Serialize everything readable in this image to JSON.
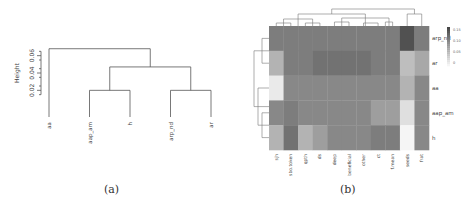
{
  "chart_data": [
    {
      "type": "dendrogram",
      "caption": "(a)",
      "ylabel": "Height",
      "yticks": [
        "0.02",
        "0.04",
        "0.06"
      ],
      "ylim": [
        0.01,
        0.07
      ],
      "leaves": [
        "aa",
        "aap_am",
        "h",
        "arp_nd",
        "ar"
      ],
      "merges": [
        {
          "left": "aap_am",
          "right": "h",
          "height": 0.02
        },
        {
          "left": "arp_nd",
          "right": "ar",
          "height": 0.02
        },
        {
          "left": "aap_am+h",
          "right": "arp_nd+ar",
          "height": 0.047
        },
        {
          "left": "aa",
          "right": "rest",
          "height": 0.068
        }
      ]
    },
    {
      "type": "heatmap",
      "caption": "(b)",
      "rows": [
        "arp_nd",
        "ar",
        "aa",
        "aap_am",
        "h"
      ],
      "columns": [
        "sjh",
        "sbo.token",
        "qpth",
        "ds",
        "deep",
        "beneficial",
        "other",
        "ct",
        "f.mean",
        "seeds",
        "frat"
      ],
      "legend": {
        "ticks": [
          "0.15",
          "0.10",
          "0.05",
          "0"
        ],
        "range": [
          0,
          0.16
        ]
      },
      "values": [
        [
          0.11,
          0.11,
          0.11,
          0.11,
          0.11,
          0.11,
          0.11,
          0.11,
          0.11,
          0.15,
          0.11
        ],
        [
          0.06,
          0.11,
          0.11,
          0.12,
          0.12,
          0.12,
          0.12,
          0.11,
          0.11,
          0.05,
          0.07
        ],
        [
          0.01,
          0.1,
          0.1,
          0.1,
          0.1,
          0.1,
          0.1,
          0.1,
          0.1,
          0.06,
          0.1
        ],
        [
          0.1,
          0.11,
          0.1,
          0.1,
          0.1,
          0.1,
          0.1,
          0.08,
          0.08,
          0.02,
          0.1
        ],
        [
          0.06,
          0.12,
          0.06,
          0.08,
          0.1,
          0.1,
          0.1,
          0.11,
          0.11,
          0.0,
          0.1
        ]
      ]
    }
  ]
}
